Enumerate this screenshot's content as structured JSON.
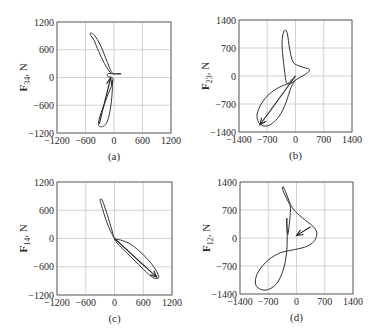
{
  "figure": {
    "panels": [
      {
        "id": "a",
        "label": "(a)",
        "ylabel_main": "F",
        "ylabel_sub": "34",
        "ylabel_unit": ", N"
      },
      {
        "id": "b",
        "label": "(b)",
        "ylabel_main": "F",
        "ylabel_sub": "23",
        "ylabel_unit": ", N"
      },
      {
        "id": "c",
        "label": "(c)",
        "ylabel_main": "F",
        "ylabel_sub": "14",
        "ylabel_unit": ", N"
      },
      {
        "id": "d",
        "label": "(d)",
        "ylabel_main": "F",
        "ylabel_sub": "12",
        "ylabel_unit": ", N"
      }
    ]
  },
  "chart_data": [
    {
      "type": "line",
      "panel": "(a)",
      "title": "",
      "xlabel": "",
      "ylabel": "F34, N",
      "xlim": [
        -1200,
        1200
      ],
      "ylim": [
        -1200,
        1200
      ],
      "xticks": [
        -1200,
        -600,
        0,
        600,
        1200
      ],
      "yticks": [
        -1200,
        -600,
        0,
        600,
        1200
      ],
      "grid": true,
      "series": [
        {
          "name": "force locus",
          "x": [
            -60,
            -200,
            -320,
            -420,
            -500,
            -470,
            -380,
            -260,
            -160,
            -80,
            -40,
            -20,
            0,
            150,
            -20,
            -130,
            -130,
            -40,
            -20,
            -60,
            -140,
            -230,
            -300,
            -330,
            -300,
            -220,
            -140,
            -80,
            -40,
            -30
          ],
          "y": [
            80,
            300,
            560,
            800,
            930,
            960,
            870,
            640,
            380,
            180,
            100,
            80,
            80,
            80,
            80,
            80,
            20,
            0,
            -60,
            -200,
            -400,
            -650,
            -850,
            -1000,
            -1060,
            -1050,
            -950,
            -700,
            -350,
            -50
          ]
        }
      ],
      "arrow": {
        "from": [
          -310,
          -1000
        ],
        "to": [
          -70,
          -10
        ]
      }
    },
    {
      "type": "line",
      "panel": "(b)",
      "title": "",
      "xlabel": "",
      "ylabel": "F23, N",
      "xlim": [
        -1400,
        1400
      ],
      "ylim": [
        -1400,
        1400
      ],
      "xticks": [
        -1400,
        -700,
        0,
        700,
        1400
      ],
      "yticks": [
        -1400,
        -700,
        0,
        700,
        1400
      ],
      "grid": true,
      "series": [
        {
          "name": "force locus",
          "x": [
            0,
            -100,
            -180,
            -230,
            -280,
            -330,
            -320,
            -260,
            -200,
            -150,
            -60,
            100,
            250,
            330,
            340,
            250,
            120,
            0,
            -100,
            -200,
            -400,
            -650,
            -850,
            -950,
            -920,
            -780,
            -600,
            -400,
            -250,
            -150,
            -80,
            0
          ],
          "y": [
            0,
            -100,
            -180,
            -150,
            200,
            700,
            1000,
            1150,
            1050,
            700,
            350,
            250,
            200,
            180,
            120,
            50,
            -30,
            -100,
            -180,
            -200,
            -280,
            -450,
            -700,
            -950,
            -1150,
            -1250,
            -1200,
            -1000,
            -700,
            -400,
            -220,
            -100
          ]
        }
      ],
      "arrow": {
        "from": [
          0,
          0
        ],
        "to": [
          -880,
          -1220
        ]
      }
    },
    {
      "type": "line",
      "panel": "(c)",
      "title": "",
      "xlabel": "",
      "ylabel": "F14, N",
      "xlim": [
        -1200,
        1200
      ],
      "ylim": [
        -1200,
        1200
      ],
      "xticks": [
        -1200,
        -600,
        0,
        600,
        1200
      ],
      "yticks": [
        -1200,
        -600,
        0,
        600,
        1200
      ],
      "grid": true,
      "series": [
        {
          "name": "force locus",
          "x": [
            0,
            -80,
            -180,
            -270,
            -300,
            -250,
            -150,
            -60,
            0,
            120,
            300,
            500,
            700,
            850,
            920,
            900,
            800,
            650,
            450,
            250,
            100,
            20,
            0
          ],
          "y": [
            0,
            150,
            400,
            700,
            830,
            800,
            500,
            200,
            0,
            -30,
            -100,
            -250,
            -450,
            -650,
            -800,
            -850,
            -830,
            -700,
            -500,
            -300,
            -150,
            -50,
            0
          ]
        }
      ],
      "arrow": {
        "from": [
          0,
          0
        ],
        "to": [
          880,
          -820
        ]
      }
    },
    {
      "type": "line",
      "panel": "(d)",
      "title": "",
      "xlabel": "",
      "ylabel": "F12, N",
      "xlim": [
        -1400,
        1400
      ],
      "ylim": [
        -1400,
        1400
      ],
      "xticks": [
        -1400,
        -700,
        0,
        700,
        1400
      ],
      "yticks": [
        -1400,
        -700,
        0,
        700,
        1400
      ],
      "grid": true,
      "series": [
        {
          "name": "force locus",
          "x": [
            -240,
            -240,
            -210,
            -150,
            -200,
            -300,
            -350,
            -320,
            -250,
            -100,
            150,
            400,
            500,
            480,
            400,
            200,
            -100,
            -400,
            -700,
            -950,
            -1020,
            -950,
            -750,
            -500,
            -330,
            -250,
            -230,
            -240
          ],
          "y": [
            500,
            300,
            100,
            700,
            900,
            1100,
            1250,
            1270,
            1100,
            750,
            500,
            300,
            150,
            0,
            -120,
            -230,
            -300,
            -370,
            -550,
            -850,
            -1100,
            -1250,
            -1300,
            -1150,
            -800,
            -400,
            0,
            500
          ]
        }
      ],
      "arrow": {
        "from": [
          350,
          280
        ],
        "to": [
          0,
          60
        ]
      }
    }
  ]
}
